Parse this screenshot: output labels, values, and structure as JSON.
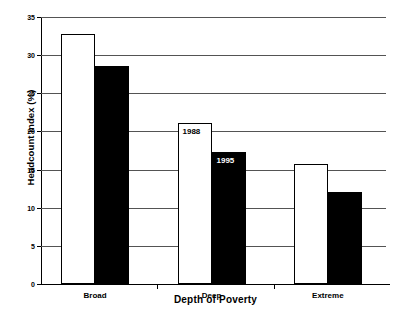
{
  "chart_data": {
    "type": "bar",
    "title": "",
    "xlabel": "Depth of Poverty",
    "ylabel": "Headcount Index (%)",
    "categories": [
      "Broad",
      "Deep",
      "Extreme"
    ],
    "series": [
      {
        "name": "1988",
        "values": [
          32.8,
          21.1,
          15.7
        ],
        "color": "#ffffff",
        "edge_color": "#000000"
      },
      {
        "name": "1995",
        "values": [
          28.6,
          17.3,
          12.1
        ],
        "color": "#000000",
        "edge_color": "#000000"
      }
    ],
    "ylim": [
      0,
      35
    ],
    "yticks": [
      0,
      5,
      10,
      15,
      20,
      25,
      30,
      35
    ],
    "ytick_labels": [
      "0",
      "5",
      "10",
      "15",
      "20",
      "25",
      "30",
      "35"
    ],
    "grid": true,
    "grid_axis": "y",
    "legend": "inline-annotations",
    "annotations": [
      {
        "text": "1988",
        "series": "1988",
        "category": "Deep",
        "placement": "inside-top-light-bar"
      },
      {
        "text": "1995",
        "series": "1995",
        "category": "Deep",
        "placement": "inside-top-dark-bar"
      }
    ]
  },
  "axes": {
    "y_title": "Headcount Index (%)",
    "x_title": "Depth of Poverty"
  }
}
